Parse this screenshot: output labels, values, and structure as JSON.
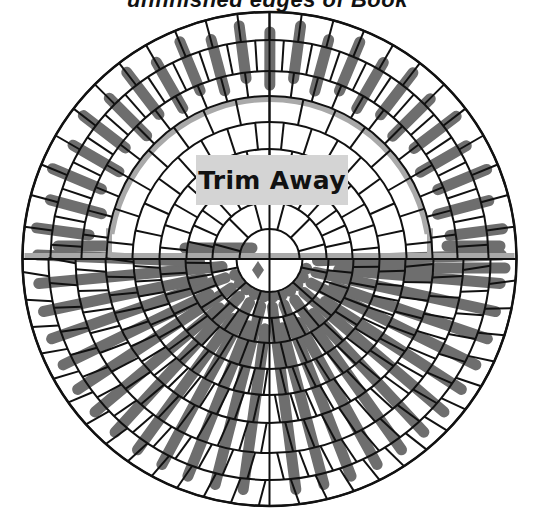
{
  "title": "unfinished edges of Book",
  "label": {
    "text": "Trim Away",
    "x": 196,
    "y": 155,
    "w": 152,
    "h": 50,
    "bg": "#d4d4d4"
  },
  "colors": {
    "line": "#111111",
    "bar_dark": "#6e6e6e",
    "frame_gray": "#a9a9a9",
    "background": "#ffffff"
  },
  "chart_data": {
    "type": "diagram",
    "center": [
      269.5,
      259
    ],
    "outer_radius": 247,
    "ring_radii": [
      30,
      57,
      83,
      110,
      137,
      163,
      188,
      219,
      247
    ],
    "bottom_ring_radii": [
      33,
      59,
      84,
      110,
      136,
      164,
      194,
      221,
      247
    ],
    "top_spokes": {
      "inner": {
        "from_r": 30,
        "to_r": 163,
        "step_deg": 12
      },
      "outer": {
        "from_r": 163,
        "to_r": 247,
        "step_deg": 7.5
      }
    },
    "bottom_spokes": {
      "from_r": 30,
      "to_r": 247,
      "step_deg": 6.5
    },
    "frame": {
      "radius": 160,
      "arc_start_deg": 190,
      "arc_end_deg": 350,
      "left_x": 109,
      "right_x": 430,
      "base_y": 256,
      "width": 6
    },
    "top_bars": {
      "from_r": 180,
      "to_r": 235,
      "start_deg": 184,
      "end_deg": 356,
      "step_deg": 7.5,
      "width": 11
    },
    "bottom_bars": {
      "count": 26,
      "start_deg": 2,
      "end_deg": 178,
      "width": 11
    },
    "center_marks": [
      {
        "shape": "diamond",
        "x": 258,
        "y": 270
      }
    ]
  }
}
